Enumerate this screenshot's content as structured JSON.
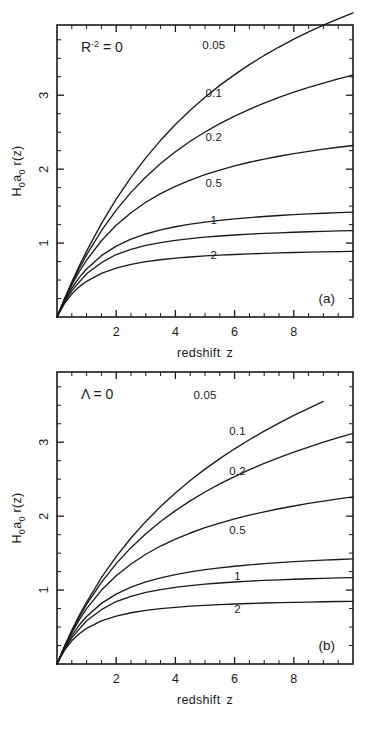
{
  "figure": {
    "background": "#ffffff",
    "ink_color": "#1a1a1a"
  },
  "panels": [
    {
      "id": "a",
      "panel_label": "(a)",
      "annotation_base": "R",
      "annotation_exp": "-2",
      "annotation_rest": " = 0",
      "annotation_plain": "R-2 = 0",
      "xlabel_word1": "redshift",
      "xlabel_word2": "z",
      "ylabel_h": "H",
      "ylabel_h_sub": "0",
      "ylabel_a": "a",
      "ylabel_a_sub": "0",
      "ylabel_r": " r(z)",
      "ylabel_plain": "H0 a0 r(z)",
      "xticks": [
        "2",
        "4",
        "6",
        "8"
      ],
      "yticks": [
        "1",
        "2",
        "3"
      ]
    },
    {
      "id": "b",
      "panel_label": "(b)",
      "annotation_base": "Λ",
      "annotation_exp": "",
      "annotation_rest": " = 0",
      "annotation_plain": "Λ = 0",
      "xlabel_word1": "redshift",
      "xlabel_word2": "z",
      "ylabel_h": "H",
      "ylabel_h_sub": "0",
      "ylabel_a": "a",
      "ylabel_a_sub": "0",
      "ylabel_r": " r(z)",
      "ylabel_plain": "H0 a0 r(z)",
      "xticks": [
        "2",
        "4",
        "6",
        "8"
      ],
      "yticks": [
        "1",
        "2",
        "3"
      ]
    }
  ],
  "chart_data": [
    {
      "type": "line",
      "title": "R-2 = 0",
      "panel": "(a)",
      "xlabel": "redshift z",
      "ylabel": "H0 a0 r(z)",
      "xlim": [
        0,
        10
      ],
      "ylim": [
        0,
        3.95
      ],
      "grid": false,
      "legend": "inline-curve-labels",
      "xticks": [
        2,
        4,
        6,
        8
      ],
      "yticks": [
        1,
        2,
        3
      ],
      "xminor_step": 0.5,
      "yminor_step": 0.25,
      "series": [
        {
          "name": "0.05",
          "label": "0.05",
          "label_xy": [
            5.3,
            3.62
          ],
          "x": [
            0,
            0.25,
            0.5,
            0.75,
            1,
            1.5,
            2,
            2.5,
            3,
            3.5,
            4,
            4.5,
            5,
            5.5,
            6,
            6.5,
            7,
            7.5,
            8,
            8.5,
            9,
            9.5,
            10
          ],
          "values": [
            0,
            0.243,
            0.472,
            0.688,
            0.891,
            1.263,
            1.594,
            1.889,
            2.153,
            2.39,
            2.604,
            2.797,
            2.973,
            3.133,
            3.279,
            3.414,
            3.538,
            3.652,
            3.758,
            3.856,
            3.948,
            4.033,
            4.113
          ]
        },
        {
          "name": "0.1",
          "label": "0.1",
          "label_xy": [
            5.3,
            2.97
          ],
          "x": [
            0,
            0.25,
            0.5,
            0.75,
            1,
            1.5,
            2,
            2.5,
            3,
            3.5,
            4,
            4.5,
            5,
            5.5,
            6,
            6.5,
            7,
            7.5,
            8,
            8.5,
            9,
            9.5,
            10
          ],
          "values": [
            0,
            0.238,
            0.456,
            0.656,
            0.84,
            1.167,
            1.446,
            1.686,
            1.894,
            2.076,
            2.236,
            2.377,
            2.503,
            2.616,
            2.718,
            2.81,
            2.894,
            2.971,
            3.041,
            3.105,
            3.165,
            3.22,
            3.271
          ]
        },
        {
          "name": "0.2",
          "label": "0.2",
          "label_xy": [
            5.3,
            2.38
          ],
          "x": [
            0,
            0.25,
            0.5,
            0.75,
            1,
            1.5,
            2,
            2.5,
            3,
            3.5,
            4,
            4.5,
            5,
            5.5,
            6,
            6.5,
            7,
            7.5,
            8,
            8.5,
            9,
            9.5,
            10
          ],
          "values": [
            0,
            0.231,
            0.434,
            0.612,
            0.769,
            1.031,
            1.241,
            1.411,
            1.552,
            1.669,
            1.768,
            1.852,
            1.925,
            1.988,
            2.044,
            2.093,
            2.136,
            2.175,
            2.21,
            2.241,
            2.27,
            2.296,
            2.32
          ]
        },
        {
          "name": "0.5",
          "label": "0.5",
          "label_xy": [
            5.3,
            1.76
          ],
          "x": [
            0,
            0.25,
            0.5,
            0.75,
            1,
            1.5,
            2,
            2.5,
            3,
            3.5,
            4,
            4.5,
            5,
            5.5,
            6,
            6.5,
            7,
            7.5,
            8,
            8.5,
            9,
            9.5,
            10
          ],
          "values": [
            0,
            0.215,
            0.389,
            0.532,
            0.65,
            0.83,
            0.958,
            1.052,
            1.123,
            1.178,
            1.221,
            1.256,
            1.284,
            1.308,
            1.328,
            1.345,
            1.36,
            1.373,
            1.384,
            1.394,
            1.403,
            1.411,
            1.418
          ]
        },
        {
          "name": "1",
          "label": "1",
          "label_xy": [
            5.3,
            1.26
          ],
          "x": [
            0,
            0.25,
            0.5,
            0.75,
            1,
            1.5,
            2,
            2.5,
            3,
            3.5,
            4,
            4.5,
            5,
            5.5,
            6,
            6.5,
            7,
            7.5,
            8,
            8.5,
            9,
            9.5,
            10
          ],
          "values": [
            0,
            0.2,
            0.354,
            0.472,
            0.586,
            0.735,
            0.845,
            0.916,
            0.968,
            1.007,
            1.037,
            1.061,
            1.08,
            1.096,
            1.109,
            1.121,
            1.131,
            1.139,
            1.147,
            1.153,
            1.159,
            1.164,
            1.169
          ]
        },
        {
          "name": "2",
          "label": "2",
          "label_xy": [
            5.3,
            0.79
          ],
          "x": [
            0,
            0.25,
            0.5,
            0.75,
            1,
            1.5,
            2,
            2.5,
            3,
            3.5,
            4,
            4.5,
            5,
            5.5,
            6,
            6.5,
            7,
            7.5,
            8,
            8.5,
            9,
            9.5,
            10
          ],
          "values": [
            0,
            0.181,
            0.31,
            0.408,
            0.483,
            0.59,
            0.662,
            0.712,
            0.748,
            0.775,
            0.796,
            0.812,
            0.826,
            0.837,
            0.846,
            0.854,
            0.861,
            0.867,
            0.872,
            0.877,
            0.881,
            0.885,
            0.888
          ]
        }
      ]
    },
    {
      "type": "line",
      "title": "Λ = 0",
      "panel": "(b)",
      "xlabel": "redshift z",
      "ylabel": "H0 a0 r(z)",
      "xlim": [
        0,
        10
      ],
      "ylim": [
        0,
        3.95
      ],
      "grid": false,
      "legend": "inline-curve-labels",
      "xticks": [
        2,
        4,
        6,
        8
      ],
      "yticks": [
        1,
        2,
        3
      ],
      "xminor_step": 0.5,
      "yminor_step": 0.25,
      "series": [
        {
          "name": "0.05",
          "label": "0.05",
          "label_xy": [
            5.0,
            3.58
          ],
          "x": [
            0,
            0.25,
            0.5,
            0.75,
            1,
            1.5,
            2,
            2.5,
            3,
            3.5,
            4,
            4.5,
            5,
            5.5,
            6,
            6.5,
            7,
            7.5,
            8,
            8.5,
            9
          ],
          "values": [
            0,
            0.238,
            0.455,
            0.655,
            0.838,
            1.167,
            1.453,
            1.705,
            1.929,
            2.131,
            2.314,
            2.482,
            2.636,
            2.778,
            2.911,
            3.034,
            3.15,
            3.259,
            3.362,
            3.459,
            3.552
          ]
        },
        {
          "name": "0.1",
          "label": "0.1",
          "label_xy": [
            6.1,
            3.1
          ],
          "x": [
            0,
            0.25,
            0.5,
            0.75,
            1,
            1.5,
            2,
            2.5,
            3,
            3.5,
            4,
            4.5,
            5,
            5.5,
            6,
            6.5,
            7,
            7.5,
            8,
            8.5,
            9,
            9.5,
            10
          ],
          "values": [
            0,
            0.234,
            0.444,
            0.634,
            0.806,
            1.105,
            1.358,
            1.574,
            1.762,
            1.928,
            2.075,
            2.207,
            2.327,
            2.436,
            2.536,
            2.628,
            2.713,
            2.792,
            2.866,
            2.935,
            3.0,
            3.061,
            3.119
          ]
        },
        {
          "name": "0.2",
          "label": "0.2",
          "label_xy": [
            6.1,
            2.55
          ],
          "x": [
            0,
            0.25,
            0.5,
            0.75,
            1,
            1.5,
            2,
            2.5,
            3,
            3.5,
            4,
            4.5,
            5,
            5.5,
            6,
            6.5,
            7,
            7.5,
            8,
            8.5,
            9,
            9.5,
            10
          ],
          "values": [
            0,
            0.227,
            0.425,
            0.597,
            0.748,
            0.997,
            1.194,
            1.353,
            1.485,
            1.596,
            1.69,
            1.772,
            1.844,
            1.907,
            1.963,
            2.013,
            2.059,
            2.1,
            2.137,
            2.172,
            2.203,
            2.233,
            2.26
          ]
        },
        {
          "name": "0.5",
          "label": "0.5",
          "label_xy": [
            6.1,
            1.76
          ],
          "x": [
            0,
            0.25,
            0.5,
            0.75,
            1,
            1.5,
            2,
            2.5,
            3,
            3.5,
            4,
            4.5,
            5,
            5.5,
            6,
            6.5,
            7,
            7.5,
            8,
            8.5,
            9,
            9.5,
            10
          ],
          "values": [
            0,
            0.214,
            0.386,
            0.527,
            0.643,
            0.82,
            0.946,
            1.039,
            1.11,
            1.165,
            1.21,
            1.246,
            1.276,
            1.301,
            1.322,
            1.341,
            1.357,
            1.371,
            1.384,
            1.395,
            1.405,
            1.414,
            1.422
          ]
        },
        {
          "name": "1",
          "label": "1",
          "label_xy": [
            6.1,
            1.13
          ],
          "x": [
            0,
            0.25,
            0.5,
            0.75,
            1,
            1.5,
            2,
            2.5,
            3,
            3.5,
            4,
            4.5,
            5,
            5.5,
            6,
            6.5,
            7,
            7.5,
            8,
            8.5,
            9,
            9.5,
            10
          ],
          "values": [
            0,
            0.2,
            0.354,
            0.472,
            0.586,
            0.735,
            0.845,
            0.916,
            0.968,
            1.007,
            1.037,
            1.061,
            1.08,
            1.096,
            1.109,
            1.121,
            1.131,
            1.139,
            1.147,
            1.153,
            1.159,
            1.164,
            1.169
          ]
        },
        {
          "name": "2",
          "label": "2",
          "label_xy": [
            6.1,
            0.69
          ],
          "x": [
            0,
            0.25,
            0.5,
            0.75,
            1,
            1.5,
            2,
            2.5,
            3,
            3.5,
            4,
            4.5,
            5,
            5.5,
            6,
            6.5,
            7,
            7.5,
            8,
            8.5,
            9,
            9.5,
            10
          ],
          "values": [
            0,
            0.184,
            0.314,
            0.41,
            0.482,
            0.583,
            0.648,
            0.693,
            0.725,
            0.749,
            0.767,
            0.782,
            0.794,
            0.803,
            0.812,
            0.819,
            0.825,
            0.83,
            0.834,
            0.838,
            0.842,
            0.845,
            0.848
          ]
        }
      ]
    }
  ]
}
